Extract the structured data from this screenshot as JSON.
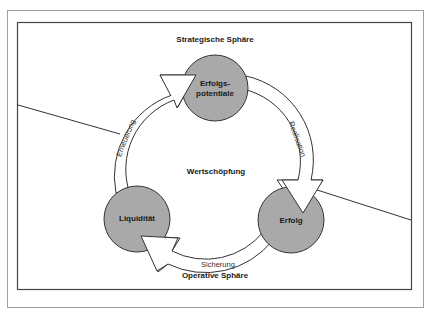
{
  "diagram": {
    "title_top": "Strategische Sphäre",
    "title_bottom": "Operative Sphäre",
    "center_label": "Wertschöpfung",
    "nodes": [
      {
        "id": "erfolgspotentiale",
        "line1": "Erfolgs-",
        "line2": "potentiale"
      },
      {
        "id": "erfolg",
        "label": "Erfolg"
      },
      {
        "id": "liquiditaet",
        "label": "Liquidität"
      }
    ],
    "arrows": [
      {
        "from": "erfolgspotentiale",
        "to": "erfolg",
        "label": "Realisation"
      },
      {
        "from": "erfolg",
        "to": "liquiditaet",
        "label": "Sicherung"
      },
      {
        "from": "liquiditaet",
        "to": "erfolgspotentiale",
        "label": "Erneuerung"
      }
    ],
    "colors": {
      "node_fill": "#a9a9a9",
      "stroke": "#333333",
      "arrow_fill": "#ffffff",
      "outer_frame": "#9a9a9a",
      "inner_frame": "#444444"
    }
  }
}
